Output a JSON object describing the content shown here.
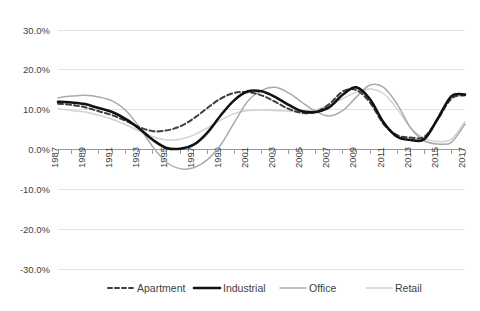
{
  "chart_data": {
    "type": "line",
    "title": "",
    "subtitle": "",
    "xlabel": "",
    "ylabel": "",
    "grid": true,
    "legend_position": "bottom",
    "xlim": [
      1987,
      2017
    ],
    "ylim": [
      -30,
      30
    ],
    "y_tick_labels": [
      "30.0%",
      "20.0%",
      "10.0%",
      "0.0%",
      "-10.0%",
      "-20.0%",
      "-30.0%"
    ],
    "y_tick_values": [
      30,
      20,
      10,
      0,
      -10,
      -20,
      -30
    ],
    "x_tick_labels": [
      "1987",
      "1989",
      "1991",
      "1993",
      "1995",
      "1997",
      "1999",
      "2001",
      "2003",
      "2005",
      "2007",
      "2009",
      "2011",
      "2013",
      "2015",
      "2017"
    ],
    "x": [
      1987,
      1988,
      1989,
      1990,
      1991,
      1992,
      1993,
      1994,
      1995,
      1996,
      1997,
      1998,
      1999,
      2000,
      2001,
      2002,
      2003,
      2004,
      2005,
      2006,
      2007,
      2008,
      2009,
      2010,
      2011,
      2012,
      2013,
      2014,
      2015,
      2016,
      2017
    ],
    "series": [
      {
        "name": "Apartment",
        "color": "#3f3f3f",
        "style": "dashed",
        "width": 2,
        "values": [
          11.5,
          11.2,
          10.6,
          9.6,
          8.6,
          7.2,
          5.6,
          4.6,
          4.8,
          5.8,
          7.8,
          10.4,
          12.8,
          14.2,
          14.4,
          13.6,
          12.0,
          10.2,
          9.2,
          9.4,
          11.4,
          14.6,
          14.9,
          11.8,
          6.4,
          3.6,
          3.0,
          3.2,
          7.6,
          12.8,
          13.6
        ]
      },
      {
        "name": "Industrial",
        "color": "#111111",
        "style": "solid",
        "width": 2.6,
        "values": [
          12.0,
          11.8,
          11.4,
          10.4,
          9.4,
          7.6,
          5.2,
          2.4,
          0.4,
          0.2,
          1.2,
          4.2,
          8.6,
          12.4,
          14.6,
          14.6,
          13.2,
          11.2,
          9.6,
          9.4,
          10.6,
          13.8,
          15.6,
          12.6,
          6.8,
          3.2,
          2.4,
          2.6,
          7.8,
          13.4,
          13.8
        ]
      },
      {
        "name": "Office",
        "color": "#aaaaaa",
        "style": "solid",
        "width": 1.5,
        "values": [
          13.0,
          13.4,
          13.6,
          13.2,
          12.2,
          9.8,
          5.6,
          0.6,
          -3.2,
          -4.8,
          -4.6,
          -2.6,
          1.2,
          6.8,
          12.2,
          14.8,
          15.6,
          14.2,
          11.8,
          9.6,
          8.4,
          9.8,
          13.2,
          16.2,
          15.6,
          11.4,
          5.4,
          2.2,
          1.4,
          1.8,
          6.4
        ]
      },
      {
        "name": "Retail",
        "color": "#d2d2d2",
        "style": "solid",
        "width": 1.5,
        "values": [
          10.2,
          9.8,
          9.4,
          8.6,
          7.6,
          6.2,
          4.6,
          3.2,
          2.4,
          2.6,
          3.6,
          5.4,
          7.4,
          9.0,
          9.8,
          9.9,
          9.8,
          9.6,
          9.6,
          10.0,
          11.0,
          12.8,
          14.4,
          15.2,
          14.0,
          10.2,
          5.4,
          2.8,
          2.0,
          2.6,
          7.0
        ]
      }
    ]
  },
  "legend": {
    "items": [
      {
        "label": "Apartment"
      },
      {
        "label": "Industrial"
      },
      {
        "label": "Office"
      },
      {
        "label": "Retail"
      }
    ]
  }
}
